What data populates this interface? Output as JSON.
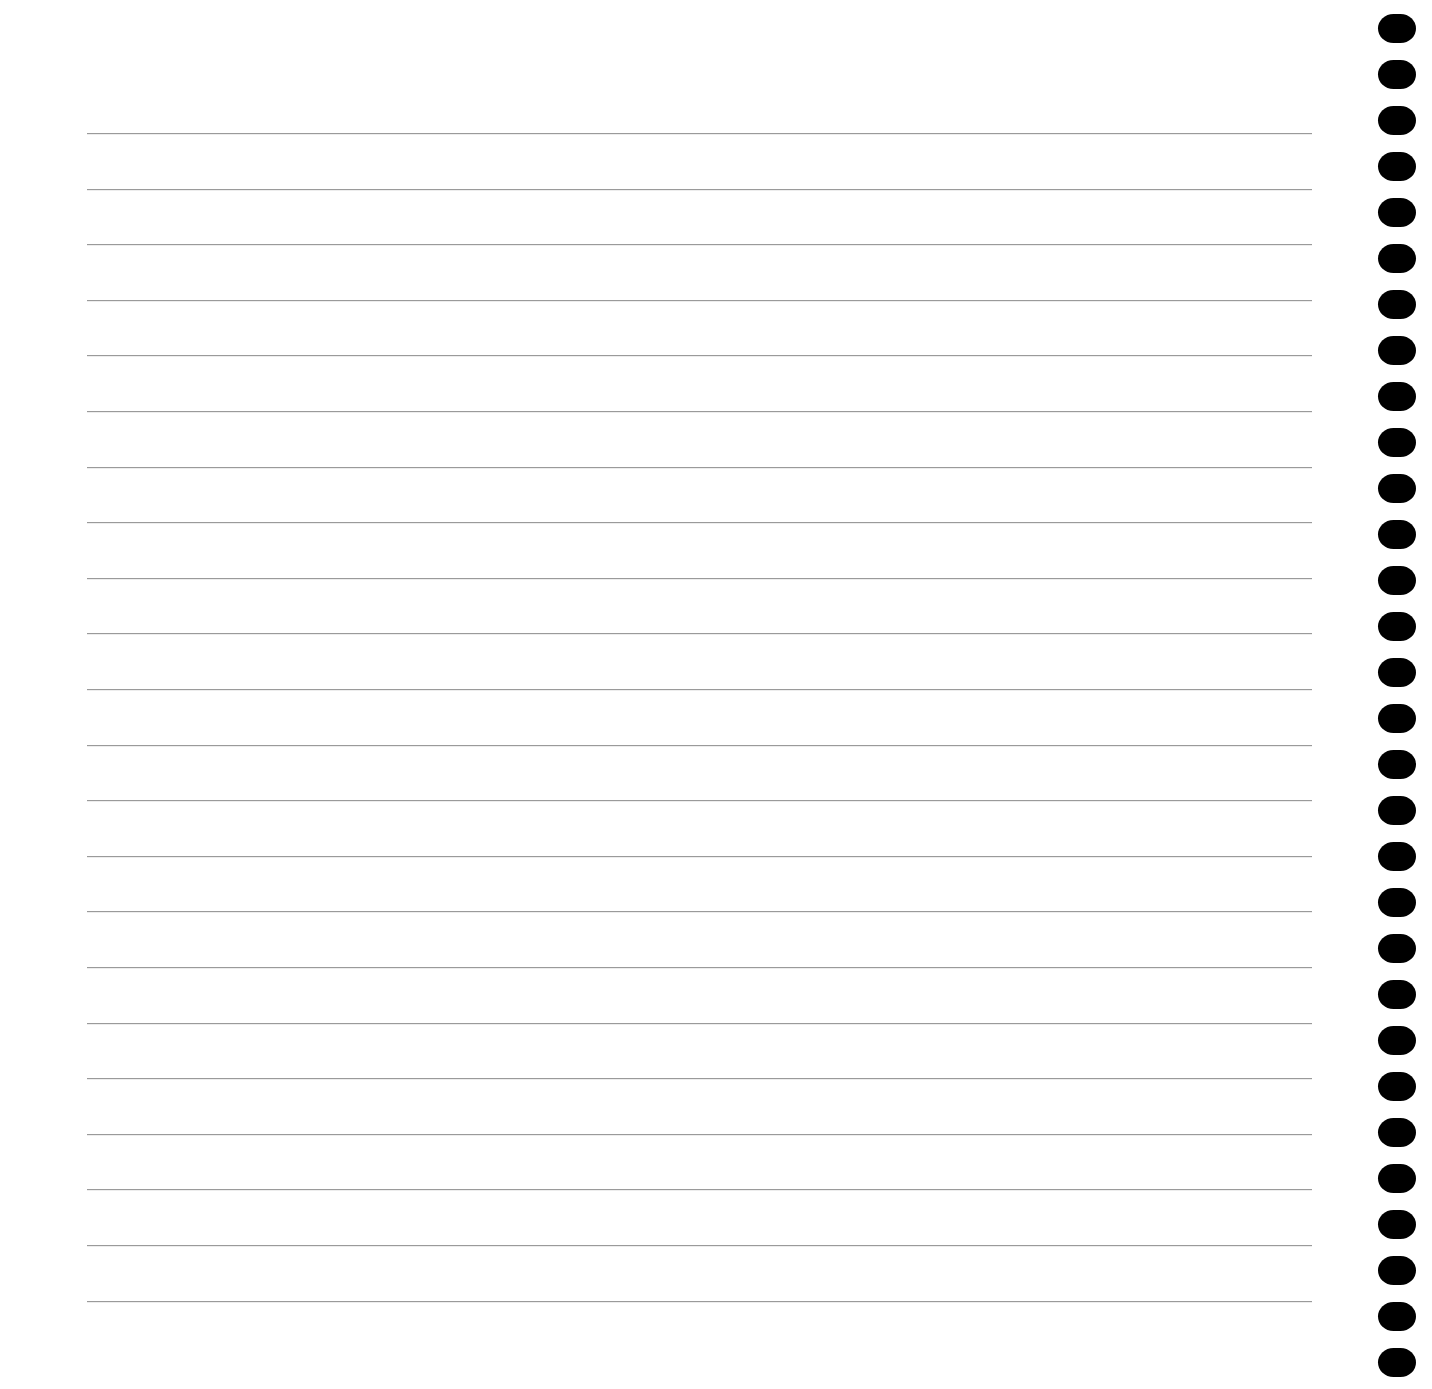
{
  "page": {
    "type": "lined-notebook-paper",
    "background_color": "#ffffff",
    "rule_color": "#9a9a9a",
    "hole_color": "#000000"
  },
  "rules": {
    "count": 22,
    "first_y": 133,
    "spacing": 55.6,
    "x_start": 87,
    "x_end": 1312
  },
  "binding_holes": {
    "count": 30,
    "first_y": 14,
    "spacing": 46,
    "x": 1378,
    "width": 38,
    "height": 29
  }
}
